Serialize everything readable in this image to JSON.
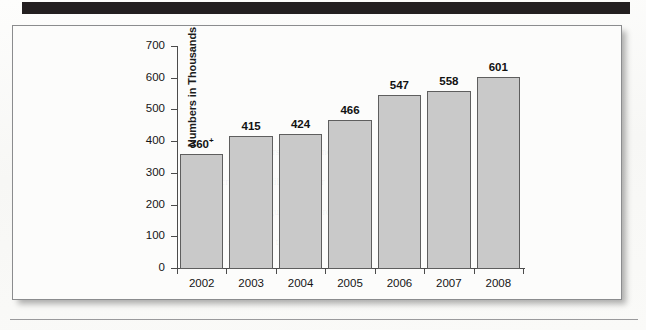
{
  "page": {
    "header_band_color": "#231f20",
    "frame_border_color": "#8b8c8e",
    "paper_color": "#fbfbfa"
  },
  "chart_data": {
    "type": "bar",
    "title": "",
    "subtitle": "",
    "xlabel": "",
    "ylabel": "Numbers in Thousands",
    "categories": [
      "2002",
      "2003",
      "2004",
      "2005",
      "2006",
      "2007",
      "2008"
    ],
    "values": [
      360,
      415,
      424,
      466,
      547,
      558,
      601
    ],
    "value_labels": [
      "360+",
      "415",
      "424",
      "466",
      "547",
      "558",
      "601"
    ],
    "ylim": [
      0,
      700
    ],
    "ytick_labels": [
      "700",
      "600",
      "500",
      "400",
      "300",
      "200",
      "100",
      "0"
    ],
    "ytick_values": [
      700,
      600,
      500,
      400,
      300,
      200,
      100,
      0
    ],
    "grid": false,
    "legend": null,
    "bar_fill_color": "#c9c9c9",
    "bar_edge_color": "#5e5e5e",
    "axis_color": "#4b4b4b"
  },
  "ghost_text": [
    "Numbers in Thousands",
    "increased steadily each year",
    "figures are approximate",
    "source data table"
  ]
}
